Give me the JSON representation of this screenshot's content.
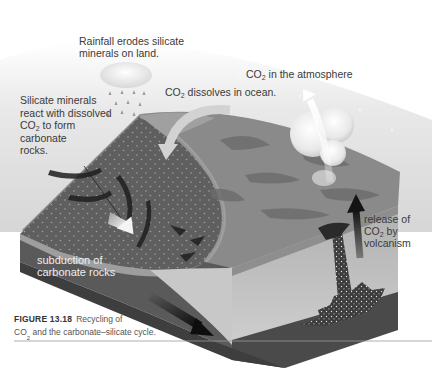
{
  "figure": {
    "number": "FIGURE 13.18",
    "caption_line1": "Recycling of",
    "caption_co2_prefix": "CO",
    "caption_co2_sub": "2",
    "caption_line2_rest": " and the carbonate–silicate cycle."
  },
  "labels": {
    "rainfall": {
      "line1": "Rainfall erodes silicate",
      "line2": "minerals on land."
    },
    "silicate": {
      "line1": "Silicate minerals",
      "line2": "react with dissolved",
      "line3_prefix": "CO",
      "line3_sub": "2",
      "line3_rest": " to form",
      "line4": "carbonate",
      "line5": "rocks."
    },
    "dissolves": {
      "prefix": "CO",
      "sub": "2",
      "rest": " dissolves in ocean."
    },
    "atmosphere": {
      "prefix": "CO",
      "sub": "2",
      "rest": " in the atmosphere"
    },
    "subduction": {
      "line1": "subduction of",
      "line2": "carbonate rocks"
    },
    "volcanism": {
      "line1": "release of",
      "line2_prefix": "CO",
      "line2_sub": "2",
      "line2_rest": " by",
      "line3": "volcanism"
    }
  },
  "colors": {
    "sky": "#e6e6e6",
    "ocean_floor": "#5e5e5e",
    "land": "#8a8a8a",
    "land_dark": "#6a6a6a",
    "crust_front": "#b4b4b4",
    "crust_side": "#9c9c9c",
    "mantle": "#4a4a4a",
    "arrow_dark": "#1e1e1e",
    "arrow_light": "#f2f2f2",
    "text": "#3a3a3a",
    "rule": "#9a9a9a"
  }
}
